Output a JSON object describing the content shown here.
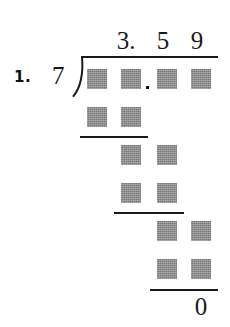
{
  "worksheet": {
    "problem_number": "1.",
    "divisor": "7",
    "quotient": {
      "digits": [
        "3.",
        "5",
        "9"
      ],
      "text": "3. 5 9"
    },
    "dividend": {
      "cells": [
        "blank",
        "blank",
        "blank",
        "blank"
      ],
      "decimal_after_column": 2
    },
    "work_rows": [
      {
        "name": "partial-product-row-1",
        "columns": [
          1,
          2
        ],
        "cells": [
          "blank",
          "blank"
        ]
      },
      {
        "name": "remainder-row-1",
        "columns": [
          2,
          3
        ],
        "cells": [
          "blank",
          "blank"
        ]
      },
      {
        "name": "partial-product-row-2",
        "columns": [
          2,
          3
        ],
        "cells": [
          "blank",
          "blank"
        ]
      },
      {
        "name": "remainder-row-2",
        "columns": [
          3,
          4
        ],
        "cells": [
          "blank",
          "blank"
        ]
      },
      {
        "name": "partial-product-row-3",
        "columns": [
          3,
          4
        ],
        "cells": [
          "blank",
          "blank"
        ]
      }
    ],
    "final_remainder": "0",
    "colors": {
      "ink": "#1a1a1a",
      "blank_cell": "#8a8a8a",
      "paper": "#ffffff"
    }
  }
}
